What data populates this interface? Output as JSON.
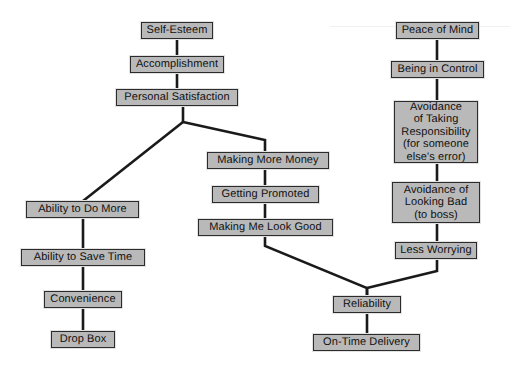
{
  "diagram": {
    "background_color": "#ffffff",
    "node_fill_color": "#b9b9b9",
    "node_border_color": "#2b2b2b",
    "edge_color": "#1a1a1a",
    "nodes": [
      {
        "id": "self-esteem",
        "label": "Self-Esteem",
        "x": 141,
        "y": 22,
        "w": 72,
        "h": 17
      },
      {
        "id": "accomplishment",
        "label": "Accomplishment",
        "x": 130,
        "y": 56,
        "w": 94,
        "h": 17
      },
      {
        "id": "personal-satisfaction",
        "label": "Personal Satisfaction",
        "x": 116,
        "y": 89,
        "w": 122,
        "h": 17
      },
      {
        "id": "ability-to-do-more",
        "label": "Ability to Do More",
        "x": 26,
        "y": 201,
        "w": 113,
        "h": 17
      },
      {
        "id": "ability-to-save-time",
        "label": "Ability to Save Time",
        "x": 21,
        "y": 249,
        "w": 124,
        "h": 17
      },
      {
        "id": "convenience",
        "label": "Convenience",
        "x": 44,
        "y": 291,
        "w": 78,
        "h": 17
      },
      {
        "id": "drop-box",
        "label": "Drop Box",
        "x": 51,
        "y": 331,
        "w": 64,
        "h": 17
      },
      {
        "id": "making-more-money",
        "label": "Making More Money",
        "x": 207,
        "y": 152,
        "w": 122,
        "h": 17
      },
      {
        "id": "getting-promoted",
        "label": "Getting Promoted",
        "x": 212,
        "y": 186,
        "w": 107,
        "h": 17
      },
      {
        "id": "making-me-look-good",
        "label": "Making Me Look Good",
        "x": 198,
        "y": 219,
        "w": 135,
        "h": 17
      },
      {
        "id": "reliability",
        "label": "Reliability",
        "x": 333,
        "y": 296,
        "w": 68,
        "h": 17
      },
      {
        "id": "on-time-delivery",
        "label": "On-Time Delivery",
        "x": 313,
        "y": 334,
        "w": 107,
        "h": 17
      },
      {
        "id": "peace-of-mind",
        "label": "Peace of Mind",
        "x": 396,
        "y": 22,
        "w": 83,
        "h": 17
      },
      {
        "id": "being-in-control",
        "label": "Being in Control",
        "x": 391,
        "y": 61,
        "w": 93,
        "h": 17
      },
      {
        "id": "avoidance-of-taking-responsibility",
        "label": "Avoidance\nof Taking\nResponsibility\n(for someone\nelse's error)",
        "x": 394,
        "y": 101,
        "w": 84,
        "h": 62
      },
      {
        "id": "avoidance-of-looking-bad",
        "label": "Avoidance of\nLooking Bad\n(to boss)",
        "x": 392,
        "y": 182,
        "w": 88,
        "h": 41
      },
      {
        "id": "less-worrying",
        "label": "Less Worrying",
        "x": 395,
        "y": 242,
        "w": 82,
        "h": 17
      }
    ],
    "edges": [
      {
        "id": "self-esteem-to-accomplishment",
        "from": "self-esteem",
        "to": "accomplishment",
        "points": "177,39 177,56"
      },
      {
        "id": "accomplishment-to-personal-satisfaction",
        "from": "accomplishment",
        "to": "personal-satisfaction",
        "points": "177,73 177,89"
      },
      {
        "id": "personal-satisfaction-fork-stem",
        "from": "personal-satisfaction",
        "to": "fork",
        "points": "183,106 183,122"
      },
      {
        "id": "fork-to-ability-to-do-more",
        "from": "fork",
        "to": "ability-to-do-more",
        "points": "183,122 83,201"
      },
      {
        "id": "fork-to-making-more-money",
        "from": "fork",
        "to": "making-more-money",
        "points": "183,122 265,140 265,152"
      },
      {
        "id": "ability-to-do-more-to-save-time",
        "from": "ability-to-do-more",
        "to": "ability-to-save-time",
        "points": "83,218 83,249"
      },
      {
        "id": "ability-to-save-time-to-convenience",
        "from": "ability-to-save-time",
        "to": "convenience",
        "points": "83,266 83,291"
      },
      {
        "id": "convenience-to-drop-box",
        "from": "convenience",
        "to": "drop-box",
        "points": "83,308 83,331"
      },
      {
        "id": "making-more-money-to-getting-promoted",
        "from": "making-more-money",
        "to": "getting-promoted",
        "points": "265,169 265,186"
      },
      {
        "id": "getting-promoted-to-making-me-look-good",
        "from": "getting-promoted",
        "to": "making-me-look-good",
        "points": "265,203 265,219"
      },
      {
        "id": "making-me-look-good-to-reliability",
        "from": "making-me-look-good",
        "to": "reliability",
        "points": "265,236 265,246 367,288 367,296"
      },
      {
        "id": "reliability-to-on-time-delivery",
        "from": "reliability",
        "to": "on-time-delivery",
        "points": "367,313 367,334"
      },
      {
        "id": "peace-of-mind-to-being-in-control",
        "from": "peace-of-mind",
        "to": "being-in-control",
        "points": "437,39 437,61"
      },
      {
        "id": "being-in-control-to-avoidance-responsibility",
        "from": "being-in-control",
        "to": "avoidance-of-taking-responsibility",
        "points": "437,78 437,101"
      },
      {
        "id": "avoidance-responsibility-to-looking-bad",
        "from": "avoidance-of-taking-responsibility",
        "to": "avoidance-of-looking-bad",
        "points": "437,163 437,182"
      },
      {
        "id": "avoidance-looking-bad-to-less-worrying",
        "from": "avoidance-of-looking-bad",
        "to": "less-worrying",
        "points": "437,223 437,242"
      },
      {
        "id": "less-worrying-to-reliability",
        "from": "less-worrying",
        "to": "reliability",
        "points": "437,259 437,271 367,288 367,296"
      }
    ]
  }
}
